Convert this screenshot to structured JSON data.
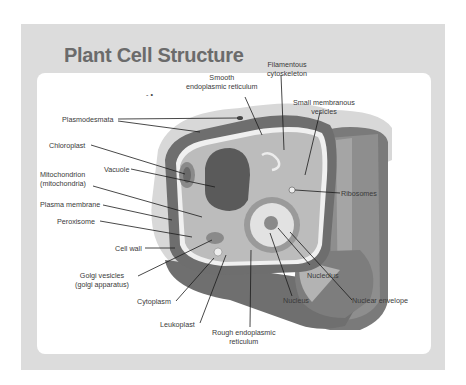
{
  "title": "Plant Cell Structure",
  "colors": {
    "outer_panel": "#dcdcdc",
    "inner_panel": "#ffffff",
    "title": "#6b6b6b",
    "cell_wall_dark": "#6f6f6f",
    "cell_wall_mid": "#8e8e8e",
    "cytoplasm": "#b8b8b8",
    "vacuole": "#555555",
    "background_blob": "#d6d6d6",
    "label_text": "#3a3a3a"
  },
  "labels": {
    "smooth_er": "Smooth\nendoplasmic reticulum",
    "filamentous_cytoskeleton": "Filamentous\ncytoskeleton",
    "small_membranous_vesicles": "Small membranous\nvesicles",
    "plasmodesmata": "Plasmodesmata",
    "chloroplast": "Chloroplast",
    "vacuole": "Vacuole",
    "mitochondrion": "Mitochondrion\n(mitochondria)",
    "plasma_membrane": "Plasma membrane",
    "peroxisome": "Peroxisome",
    "cell_wall": "Cell wall",
    "golgi_vesicles": "Golgi vesicles\n(golgi apparatus)",
    "cytoplasm": "Cytoplasm",
    "leukoplast": "Leukoplast",
    "rough_er": "Rough endoplasmic\nreticulum",
    "ribosomes": "Ribosomes",
    "nucleolus": "Nucleolus",
    "nucleus": "Nucleus",
    "nuclear_envelope": "Nuclear envelope"
  },
  "misc_marks": "- •"
}
